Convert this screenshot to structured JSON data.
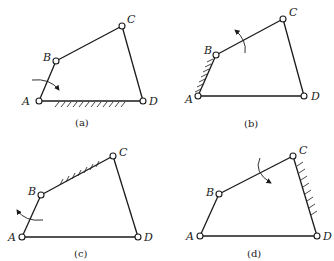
{
  "figure": {
    "panels": [
      {
        "id": "a",
        "caption": "(a)",
        "fixed_link": "AD",
        "rotating_link": "AB",
        "labels": {
          "A": "A",
          "B": "B",
          "C": "C",
          "D": "D"
        }
      },
      {
        "id": "b",
        "caption": "(b)",
        "fixed_link": "AB",
        "rotating_link": "BC",
        "labels": {
          "A": "A",
          "B": "B",
          "C": "C",
          "D": "D"
        }
      },
      {
        "id": "c",
        "caption": "(c)",
        "fixed_link": "BC",
        "rotating_link": "AB",
        "labels": {
          "A": "A",
          "B": "B",
          "C": "C",
          "D": "D"
        }
      },
      {
        "id": "d",
        "caption": "(d)",
        "fixed_link": "CD",
        "rotating_link": "BC",
        "labels": {
          "A": "A",
          "B": "B",
          "C": "C",
          "D": "D"
        }
      }
    ]
  },
  "colors": {
    "line": "#1a1a1a",
    "background": "#ffffff"
  }
}
